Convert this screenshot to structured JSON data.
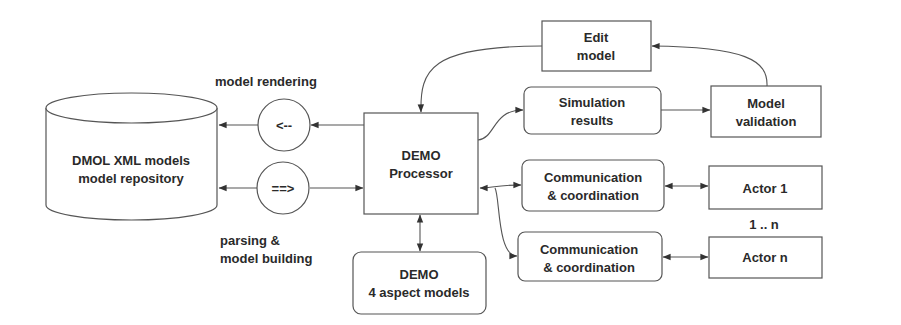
{
  "diagram": {
    "nodes": {
      "repository": {
        "lines": [
          "DMOL XML models",
          "model repository"
        ],
        "shape": "cylinder"
      },
      "render_op": {
        "label": "<--",
        "shape": "circle"
      },
      "parse_op": {
        "label": "==>",
        "shape": "circle"
      },
      "processor": {
        "lines": [
          "DEMO",
          "Processor"
        ],
        "shape": "rectangle"
      },
      "aspect_models": {
        "lines": [
          "DEMO",
          "4 aspect models"
        ],
        "shape": "rounded-rectangle"
      },
      "edit_model": {
        "lines": [
          "Edit",
          "model"
        ],
        "shape": "rectangle"
      },
      "simulation": {
        "lines": [
          "Simulation",
          "results"
        ],
        "shape": "rounded-rectangle"
      },
      "validation": {
        "lines": [
          "Model",
          "validation"
        ],
        "shape": "rectangle"
      },
      "comm1": {
        "lines": [
          "Communication",
          "& coordination"
        ],
        "shape": "rounded-rectangle"
      },
      "comm2": {
        "lines": [
          "Communication",
          "& coordination"
        ],
        "shape": "rounded-rectangle"
      },
      "actor1": {
        "label": "Actor 1",
        "shape": "rectangle"
      },
      "actorn": {
        "label": "Actor n",
        "shape": "rectangle"
      }
    },
    "annotations": {
      "model_rendering": "model rendering",
      "parsing_line1": "parsing &",
      "parsing_line2": "model building",
      "multiplicity": "1 .. n"
    },
    "edges": [
      {
        "from": "processor",
        "to": "render_op",
        "direction": "forward"
      },
      {
        "from": "render_op",
        "to": "repository",
        "direction": "forward"
      },
      {
        "from": "parse_op",
        "to": "repository",
        "direction": "backward-arrow-at-repository"
      },
      {
        "from": "parse_op",
        "to": "processor",
        "direction": "forward"
      },
      {
        "from": "processor",
        "to": "simulation",
        "direction": "forward"
      },
      {
        "from": "simulation",
        "to": "validation",
        "direction": "forward"
      },
      {
        "from": "validation",
        "to": "edit_model",
        "direction": "forward"
      },
      {
        "from": "edit_model",
        "to": "processor",
        "direction": "forward"
      },
      {
        "from": "processor",
        "to": "comm1",
        "direction": "bidirectional"
      },
      {
        "from": "processor",
        "to": "comm2",
        "direction": "forward"
      },
      {
        "from": "comm1",
        "to": "actor1",
        "direction": "bidirectional"
      },
      {
        "from": "comm2",
        "to": "actorn",
        "direction": "bidirectional"
      },
      {
        "from": "processor",
        "to": "aspect_models",
        "direction": "bidirectional"
      }
    ]
  }
}
